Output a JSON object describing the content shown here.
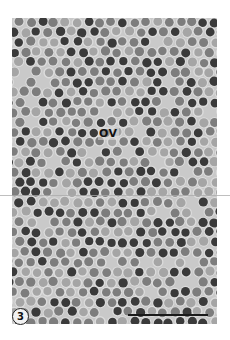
{
  "figure": {
    "type": "electron micrograph",
    "colors": {
      "background": "#c9c9c9",
      "dot_dark": "#3a3a3a",
      "dot_medium": "#7d7d7d",
      "dot_light": "#a5a5a5",
      "margin": "#ffffff"
    },
    "dot_diameter_px": 9,
    "dot_spacing_px": 11.5
  },
  "labels": {
    "region_label": "OV",
    "figure_number": "3"
  },
  "scale_bar": {
    "label": "",
    "length_px": 80
  }
}
